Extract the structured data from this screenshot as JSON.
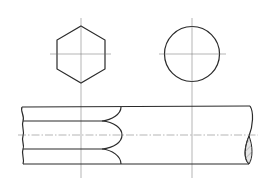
{
  "drawing": {
    "title": "",
    "type": "technical-drawing",
    "colors": {
      "line": "#2a2a2a",
      "centerline": "#6a6a6a",
      "hatch_fill": "#e6e6e6",
      "hatch_line": "#7a7a7a",
      "background": "#ffffff"
    },
    "views": [
      {
        "name": "hexagon-section",
        "shape": "hexagon",
        "hatched": true
      },
      {
        "name": "round-section",
        "shape": "circle",
        "hatched": true
      },
      {
        "name": "front-view",
        "shape": "bar-with-break",
        "features": [
          "hexagon-to-round transition arcs",
          "centerline",
          "break line with hatched section"
        ]
      }
    ]
  }
}
